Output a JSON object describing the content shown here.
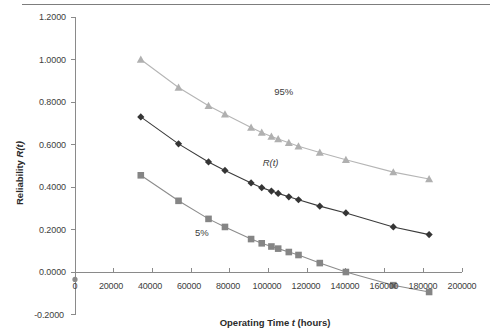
{
  "figure": {
    "background": "#ffffff",
    "rule_color": "#7d7d7d"
  },
  "chart_data": {
    "type": "line",
    "title": "",
    "xlabel": "Operating Time t (hours)",
    "ylabel": "Reliability R(t)",
    "xlim": [
      0,
      200000
    ],
    "ylim": [
      -0.2,
      1.2
    ],
    "xticks": [
      0,
      20000,
      40000,
      60000,
      80000,
      100000,
      120000,
      140000,
      160000,
      180000,
      200000
    ],
    "xtick_labels": [
      "0",
      "20000",
      "40000",
      "60000",
      "80000",
      "100000",
      "120000",
      "140000",
      "160000",
      "180000",
      "200000"
    ],
    "yticks": [
      -0.2,
      0.0,
      0.2,
      0.4,
      0.6,
      0.8,
      1.0,
      1.2
    ],
    "ytick_labels": [
      "-0.2000",
      "0.0000",
      "0.2000",
      "0.4000",
      "0.6000",
      "0.8000",
      "1.0000",
      "1.2000"
    ],
    "grid": false,
    "legend": "none",
    "annotations": [
      {
        "text": "95%",
        "x": 103000,
        "y": 0.845,
        "style": "plain"
      },
      {
        "text": "R(t)",
        "x": 97000,
        "y": 0.515,
        "style": "italic"
      },
      {
        "text": "5%",
        "x": 62000,
        "y": 0.185,
        "style": "plain"
      }
    ],
    "series": [
      {
        "name": "95%",
        "color": "#b5b5b5",
        "marker": "triangle",
        "marker_color": "#b0b0b0",
        "x": [
          34000,
          53500,
          69000,
          77500,
          91000,
          96500,
          101500,
          105000,
          110500,
          115500,
          126500,
          140000,
          164500,
          183000
        ],
        "y": [
          1.0,
          0.868,
          0.782,
          0.742,
          0.68,
          0.656,
          0.638,
          0.626,
          0.608,
          0.592,
          0.562,
          0.528,
          0.47,
          0.438
        ]
      },
      {
        "name": "R(t)",
        "color": "#3b3b3b",
        "marker": "diamond",
        "marker_color": "#353535",
        "x": [
          34000,
          53500,
          69000,
          77500,
          91000,
          96500,
          101500,
          105000,
          110500,
          115500,
          126500,
          140000,
          164500,
          183000
        ],
        "y": [
          0.73,
          0.603,
          0.518,
          0.478,
          0.419,
          0.397,
          0.381,
          0.37,
          0.354,
          0.34,
          0.31,
          0.278,
          0.212,
          0.176
        ]
      },
      {
        "name": "5%",
        "color": "#8c8c8c",
        "marker": "square",
        "marker_color": "#858585",
        "x": [
          34000,
          53500,
          69000,
          77500,
          91000,
          96500,
          101500,
          105000,
          110500,
          115500,
          126500,
          140000,
          164500,
          183000
        ],
        "y": [
          0.455,
          0.335,
          0.25,
          0.212,
          0.155,
          0.135,
          0.12,
          0.11,
          0.094,
          0.08,
          0.042,
          0.0,
          -0.062,
          -0.094
        ]
      }
    ]
  }
}
